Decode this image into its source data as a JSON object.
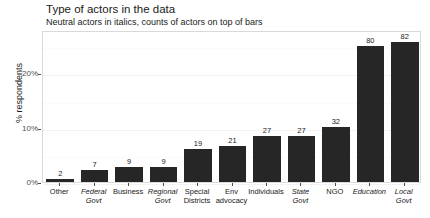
{
  "chart_data": {
    "type": "bar",
    "title": "Type of actors in the data",
    "subtitle": "Neutral actors in italics, counts of actors on top of bars",
    "xlabel": "",
    "ylabel": "% respondents",
    "categories": [
      "Other",
      "Federal\nGovt",
      "Business",
      "Regional\nGovt",
      "Special\nDistricts",
      "Env\nadvocacy",
      "Individuals",
      "State\nGovt",
      "NGO",
      "Education",
      "Local\nGovt"
    ],
    "counts": [
      2,
      7,
      9,
      9,
      19,
      21,
      27,
      27,
      32,
      80,
      82
    ],
    "values": [
      0.6,
      2.2,
      2.8,
      2.8,
      6.0,
      6.6,
      8.5,
      8.5,
      10.1,
      25.1,
      25.8
    ],
    "neutral_flags": [
      false,
      true,
      false,
      true,
      false,
      false,
      false,
      true,
      false,
      true,
      true
    ],
    "ylim": [
      0,
      28
    ],
    "yticks": [
      0,
      10,
      20
    ],
    "ytick_labels": [
      "0%",
      "10%",
      "20%"
    ],
    "grid": true,
    "legend": "none",
    "bar_color": "#262626",
    "panel_background": "#ffffff",
    "gridline_color": "#f2f2f2"
  }
}
